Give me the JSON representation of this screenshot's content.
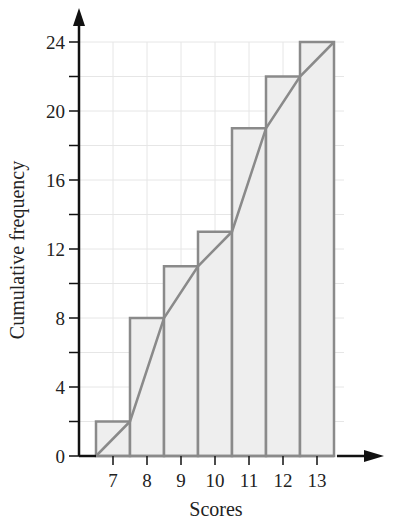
{
  "chart_data": {
    "type": "bar",
    "subtype": "cumulative-frequency-histogram-with-polygon",
    "title": "",
    "xlabel": "Scores",
    "ylabel": "Cumulative frequency",
    "categories": [
      "7",
      "8",
      "9",
      "10",
      "11",
      "12",
      "13"
    ],
    "values": [
      2,
      8,
      11,
      13,
      19,
      22,
      24
    ],
    "polygon": {
      "x": [
        6.5,
        7.5,
        8.5,
        9.5,
        10.5,
        11.5,
        12.5,
        13.5
      ],
      "y": [
        0,
        2,
        8,
        11,
        13,
        19,
        22,
        24
      ]
    },
    "yticks": [
      0,
      4,
      8,
      12,
      16,
      20,
      24
    ],
    "yticks_minor": [
      2,
      6,
      10,
      14,
      18,
      22
    ],
    "ylim": [
      0,
      24
    ],
    "xlim": [
      6.5,
      13.5
    ],
    "grid": true,
    "legend": null,
    "colors": {
      "bar_fill": "#eeeeee",
      "bar_stroke": "#8a8a8a",
      "polygon": "#8a8a8a",
      "axis": "#111111",
      "grid": "#e6e6e6"
    }
  }
}
